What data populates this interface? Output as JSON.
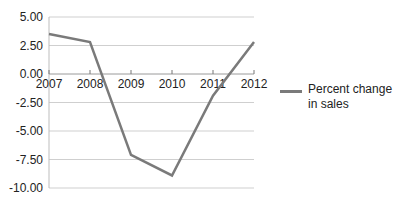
{
  "chart_data": {
    "type": "line",
    "title": "",
    "xlabel": "",
    "ylabel": "",
    "categories": [
      "2007",
      "2008",
      "2009",
      "2010",
      "2011",
      "2012"
    ],
    "series": [
      {
        "name": "Percent change in sales",
        "values": [
          3.5,
          2.8,
          -7.1,
          -8.9,
          -1.9,
          2.8
        ],
        "color": "#7a7a7a"
      }
    ],
    "yticks": [
      "5.00",
      "2.50",
      "0.00",
      "-2.50",
      "-5.00",
      "-7.50",
      "-10.00"
    ],
    "ylim": [
      -10,
      5
    ],
    "grid": true,
    "legend_position": "right"
  },
  "legend": {
    "label": "Percent change in sales"
  }
}
